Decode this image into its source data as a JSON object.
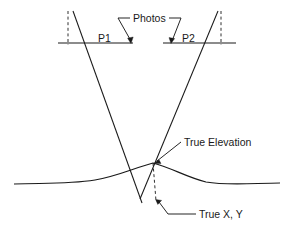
{
  "diagram": {
    "type": "technical-line-diagram",
    "colors": {
      "stroke": "#1a1a1a",
      "background": "#ffffff",
      "text": "#1a1a1a"
    },
    "labels": {
      "photos": "Photos",
      "photo_left": "P1",
      "photo_right": "P2",
      "true_elevation": "True Elevation",
      "true_xy": "True X, Y"
    },
    "geometry": {
      "photo_baseline_left": {
        "x1": 58,
        "y1": 43,
        "x2": 133,
        "y2": 43
      },
      "photo_baseline_right": {
        "x1": 163,
        "y1": 43,
        "x2": 236,
        "y2": 43
      },
      "ray_left": {
        "x1": 73,
        "y1": 11,
        "x2": 142,
        "y2": 203
      },
      "ray_right": {
        "x1": 218,
        "y1": 11,
        "x2": 140,
        "y2": 199
      },
      "dashed_vertical_left": {
        "x": 68,
        "y1": 11,
        "y2": 45
      },
      "dashed_vertical_right": {
        "x": 221,
        "y1": 11,
        "y2": 45
      },
      "dashed_vertical_center": {
        "x1": 153,
        "y1": 163,
        "x2": 156,
        "y2": 201
      },
      "intersection_point": {
        "x": 153,
        "y": 163
      },
      "terrain_profile": "M 14,184 C 50,183 70,184 95,180 C 118,176 134,168 153,163 C 172,168 186,177 206,182 C 228,186 256,183 280,183"
    }
  }
}
